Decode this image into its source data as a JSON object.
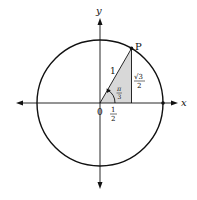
{
  "diagram": {
    "type": "unit-circle",
    "colors": {
      "stroke": "#111111",
      "shade": "#d8d8d8",
      "background": "#ffffff"
    },
    "labels": {
      "x_axis": "x",
      "y_axis": "y",
      "origin": "0",
      "point": "P",
      "hypotenuse": "1",
      "angle_num": "π",
      "angle_den": "3",
      "adjacent_num": "1",
      "adjacent_den": "2",
      "opposite_num": "√3",
      "opposite_den": "2"
    },
    "geometry": {
      "radius": 1,
      "angle": "π/3",
      "point_P": [
        "1/2",
        "√3/2"
      ]
    }
  }
}
